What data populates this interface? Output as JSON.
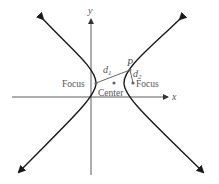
{
  "diagram": {
    "type": "hyperbola",
    "axes": {
      "x_label": "x",
      "y_label": "y"
    },
    "labels": {
      "left_focus": "Focus",
      "right_focus": "Focus",
      "center": "Center",
      "point": "P",
      "d1": "d",
      "d1_sub": "1",
      "d2": "d",
      "d2_sub": "2"
    },
    "colors": {
      "curve": "#1a1a1a",
      "axis": "#333333",
      "segment": "#555555",
      "point": "#666666"
    }
  }
}
